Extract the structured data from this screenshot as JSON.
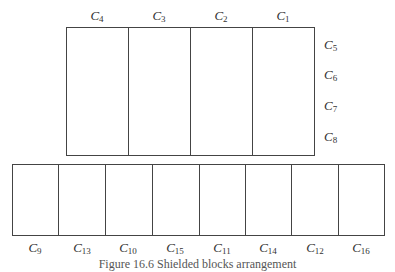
{
  "diagram": {
    "top_block": {
      "box": {
        "left": 66,
        "top": 27,
        "right": 315,
        "bottom": 156
      },
      "dividers_x": [
        128,
        190,
        252
      ],
      "top_labels": [
        {
          "base": "C",
          "sub": "4",
          "x": 97
        },
        {
          "base": "C",
          "sub": "3",
          "x": 159
        },
        {
          "base": "C",
          "sub": "2",
          "x": 221
        },
        {
          "base": "C",
          "sub": "1",
          "x": 283
        }
      ],
      "right_labels": [
        {
          "base": "C",
          "sub": "5",
          "y": 38
        },
        {
          "base": "C",
          "sub": "6",
          "y": 68
        },
        {
          "base": "C",
          "sub": "7",
          "y": 99
        },
        {
          "base": "C",
          "sub": "8",
          "y": 130
        }
      ]
    },
    "bottom_block": {
      "box": {
        "left": 12,
        "top": 164,
        "right": 385,
        "bottom": 236
      },
      "dividers_x": [
        58,
        105,
        152,
        199,
        245,
        291,
        338
      ],
      "bottom_labels": [
        {
          "base": "C",
          "sub": "9",
          "x": 35
        },
        {
          "base": "C",
          "sub": "13",
          "x": 82
        },
        {
          "base": "C",
          "sub": "10",
          "x": 128
        },
        {
          "base": "C",
          "sub": "15",
          "x": 175
        },
        {
          "base": "C",
          "sub": "11",
          "x": 222
        },
        {
          "base": "C",
          "sub": "14",
          "x": 268
        },
        {
          "base": "C",
          "sub": "12",
          "x": 315
        },
        {
          "base": "C",
          "sub": "16",
          "x": 361
        }
      ]
    },
    "caption": "Figure 16.6   Shielded blocks arrangement"
  }
}
